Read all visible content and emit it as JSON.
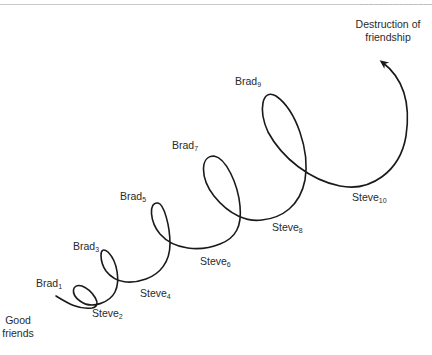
{
  "diagram": {
    "type": "spiral-escalation",
    "start_label": {
      "line1": "Good",
      "line2": "friends"
    },
    "end_label": {
      "line1": "Destruction of",
      "line2": "friendship"
    },
    "nodes": [
      {
        "name": "Brad",
        "index": "1"
      },
      {
        "name": "Steve",
        "index": "2"
      },
      {
        "name": "Brad",
        "index": "3"
      },
      {
        "name": "Steve",
        "index": "4"
      },
      {
        "name": "Brad",
        "index": "5"
      },
      {
        "name": "Steve",
        "index": "6"
      },
      {
        "name": "Brad",
        "index": "7"
      },
      {
        "name": "Steve",
        "index": "8"
      },
      {
        "name": "Brad",
        "index": "9"
      },
      {
        "name": "Steve",
        "index": "10"
      }
    ],
    "colors": {
      "line": "#1a1a1a",
      "text": "#2a2a2a",
      "rule": "#c9c9c9"
    }
  }
}
